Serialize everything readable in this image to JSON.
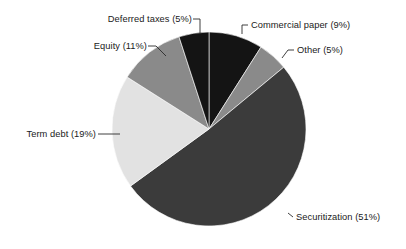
{
  "chart_data": {
    "type": "pie",
    "title": "",
    "subtitle": "",
    "xlabel": "",
    "ylabel": "",
    "legend_position": "none",
    "grid": false,
    "label_format": "{name} ({value}%)",
    "start_angle_deg": 0,
    "direction": "clockwise",
    "categories": [
      "Commercial paper",
      "Other",
      "Securitization",
      "Term debt",
      "Equity",
      "Deferred taxes"
    ],
    "values": [
      9,
      5,
      51,
      19,
      11,
      5
    ],
    "colors": [
      "#141414",
      "#8a8a8a",
      "#3b3b3b",
      "#e2e2e2",
      "#8a8a8a",
      "#141414"
    ],
    "slices": [
      {
        "name": "Commercial paper",
        "value": 9,
        "label": "Commercial paper (9%)",
        "color": "#141414",
        "start_deg": 0,
        "end_deg": 32.4
      },
      {
        "name": "Other",
        "value": 5,
        "label": "Other (5%)",
        "color": "#8a8a8a",
        "start_deg": 32.4,
        "end_deg": 50.4
      },
      {
        "name": "Securitization",
        "value": 51,
        "label": "Securitization (51%)",
        "color": "#3b3b3b",
        "start_deg": 50.4,
        "end_deg": 234.0
      },
      {
        "name": "Term debt",
        "value": 19,
        "label": "Term debt (19%)",
        "color": "#e2e2e2",
        "start_deg": 234.0,
        "end_deg": 302.4
      },
      {
        "name": "Equity",
        "value": 11,
        "label": "Equity (11%)",
        "color": "#8a8a8a",
        "start_deg": 302.4,
        "end_deg": 342.0
      },
      {
        "name": "Deferred taxes",
        "value": 5,
        "label": "Deferred taxes (5%)",
        "color": "#141414",
        "start_deg": 342.0,
        "end_deg": 360.0
      }
    ]
  },
  "labels": {
    "deferred_taxes": "Deferred taxes (5%)",
    "commercial_paper": "Commercial paper (9%)",
    "equity": "Equity (11%)",
    "other": "Other (5%)",
    "term_debt": "Term debt (19%)",
    "securitization": "Securitization (51%)"
  }
}
